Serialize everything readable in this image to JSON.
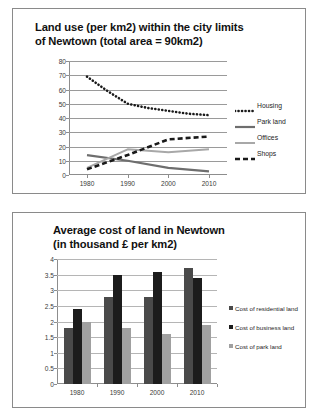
{
  "chart_data": [
    {
      "type": "line",
      "title": "Land use (per km2) within the city limits of Newtown (total area = 90km2)",
      "title_line1": "Land use (per km2) within the city limits",
      "title_line2": "of Newtown (total area = 90km2)",
      "xlabel": "",
      "ylabel": "",
      "x": [
        1980,
        1990,
        2000,
        2010
      ],
      "xtick_labels": [
        "1980",
        "1990",
        "2000",
        "2010"
      ],
      "ytick_labels": [
        "0",
        "10",
        "20",
        "30",
        "40",
        "50",
        "60",
        "70",
        "80"
      ],
      "ylim": [
        0,
        80
      ],
      "ytick_step": 10,
      "grid": true,
      "legend_position": "right",
      "series": [
        {
          "name": "Housing",
          "style": "dotted",
          "color": "#1a1a1a",
          "values": [
            69,
            50,
            45,
            42
          ],
          "points": [
            {
              "x": 1980,
              "y": 69
            },
            {
              "x": 1985,
              "y": 59
            },
            {
              "x": 1990,
              "y": 50
            },
            {
              "x": 1995,
              "y": 47
            },
            {
              "x": 2000,
              "y": 45
            },
            {
              "x": 2005,
              "y": 43
            },
            {
              "x": 2010,
              "y": 42
            }
          ]
        },
        {
          "name": "Park land",
          "style": "solid-thick",
          "color": "#6e6e6e",
          "values": [
            14,
            10,
            5,
            2.5
          ],
          "points": [
            {
              "x": 1980,
              "y": 14
            },
            {
              "x": 1990,
              "y": 10
            },
            {
              "x": 2000,
              "y": 5
            },
            {
              "x": 2010,
              "y": 2.5
            }
          ]
        },
        {
          "name": "Offices",
          "style": "solid-light",
          "color": "#a8a8a8",
          "values": [
            5,
            18,
            16,
            18
          ],
          "points": [
            {
              "x": 1980,
              "y": 5
            },
            {
              "x": 1990,
              "y": 18
            },
            {
              "x": 2000,
              "y": 16
            },
            {
              "x": 2010,
              "y": 18
            }
          ]
        },
        {
          "name": "Shops",
          "style": "dashed",
          "color": "#1a1a1a",
          "values": [
            4,
            14,
            25,
            27
          ],
          "points": [
            {
              "x": 1980,
              "y": 4
            },
            {
              "x": 1990,
              "y": 14
            },
            {
              "x": 2000,
              "y": 25
            },
            {
              "x": 2010,
              "y": 27
            }
          ]
        }
      ]
    },
    {
      "type": "bar",
      "title": "Average cost of land in Newtown (in thousand £ per km2)",
      "title_line1": "Average cost of land in Newtown",
      "title_line2": "(in thousand £ per km2)",
      "xlabel": "",
      "ylabel": "",
      "categories": [
        "1980",
        "1990",
        "2000",
        "2010"
      ],
      "ytick_labels": [
        "0",
        "0.5",
        "1",
        "1.5",
        "2",
        "2.5",
        "3",
        "3.5",
        "4"
      ],
      "ylim": [
        0,
        4
      ],
      "ytick_step": 0.5,
      "grid": true,
      "legend_position": "right",
      "series": [
        {
          "name": "Cost of residential land",
          "color": "#4a4a4a",
          "values": [
            1.8,
            2.8,
            2.8,
            3.7
          ]
        },
        {
          "name": "Cost of business land",
          "color": "#1c1c1c",
          "values": [
            2.4,
            3.5,
            3.6,
            3.4
          ]
        },
        {
          "name": "Cost of park land",
          "color": "#a0a0a0",
          "values": [
            2.0,
            1.8,
            1.6,
            1.9
          ]
        }
      ]
    }
  ]
}
